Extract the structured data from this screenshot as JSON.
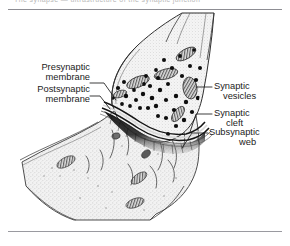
{
  "page": {
    "running_head": "The synapse — ultrastructure of the synaptic junction",
    "background_color": "#ffffff",
    "rule_color": "#8d8d93"
  },
  "figure": {
    "caption": "",
    "ink_color": "#2b2b2b",
    "cytoplasm_color": "#e9e9e9",
    "vesicle_color": "#111111",
    "subsynaptic_web_color": "#1a1a1a"
  },
  "labels": {
    "presynaptic_membrane": {
      "line1": "Presynaptic",
      "line2": "membrane"
    },
    "postsynaptic_membrane": {
      "line1": "Postsynaptic",
      "line2": "membrane"
    },
    "synaptic_vesicles": {
      "line1": "Synaptic",
      "line2": "vesicles"
    },
    "synaptic_cleft": {
      "line1": "Synaptic",
      "line2": "cleft"
    },
    "subsynaptic_web": {
      "line1": "Subsynaptic",
      "line2": "web"
    }
  }
}
